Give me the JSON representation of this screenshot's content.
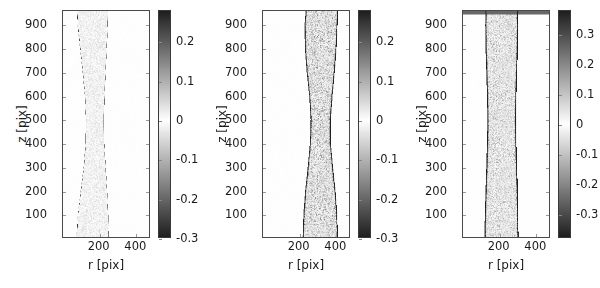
{
  "figure": {
    "background": "#ffffff",
    "panel_count": 3,
    "text_color": "#1a1a1a",
    "axis_color": "#4a4a4a"
  },
  "chart_data": [
    {
      "type": "heatmap",
      "panel_index": 0,
      "title": "",
      "xlabel": "r [pix]",
      "ylabel": "z [pix]",
      "xlim": [
        0,
        480
      ],
      "ylim": [
        0,
        960
      ],
      "xticks": [
        200,
        400
      ],
      "xticklabels": [
        "200",
        "400"
      ],
      "yticks": [
        100,
        200,
        300,
        400,
        500,
        600,
        700,
        800,
        900
      ],
      "yticklabels": [
        "100",
        "200",
        "300",
        "400",
        "500",
        "600",
        "700",
        "800",
        "900"
      ],
      "grid": false,
      "colormap": "diverging-gray",
      "colorbar": {
        "position": "right",
        "vmin": -0.3,
        "vmax": 0.28,
        "ticks": [
          0.2,
          0.1,
          0,
          -0.1,
          -0.2,
          -0.3
        ],
        "ticklabels": [
          "0.2",
          "0.1",
          "0",
          "-0.1",
          "-0.2",
          "-0.3"
        ]
      },
      "description": "Narrow bright column with thin dark boundary, pinched near mid height",
      "column": {
        "noise_amplitude": 0.05,
        "edge_darkness": 0.42,
        "edge_width": 2,
        "interior_level": 0.015,
        "profile": [
          {
            "z": 960,
            "left": 78,
            "right": 252
          },
          {
            "z": 900,
            "left": 82,
            "right": 250
          },
          {
            "z": 800,
            "left": 96,
            "right": 244
          },
          {
            "z": 700,
            "left": 110,
            "right": 238
          },
          {
            "z": 600,
            "left": 122,
            "right": 232
          },
          {
            "z": 500,
            "left": 128,
            "right": 228
          },
          {
            "z": 400,
            "left": 126,
            "right": 230
          },
          {
            "z": 300,
            "left": 116,
            "right": 238
          },
          {
            "z": 200,
            "left": 100,
            "right": 246
          },
          {
            "z": 100,
            "left": 84,
            "right": 252
          },
          {
            "z": 0,
            "left": 76,
            "right": 256
          }
        ]
      }
    },
    {
      "type": "heatmap",
      "panel_index": 1,
      "title": "",
      "xlabel": "r [pix]",
      "ylabel": "z [pix]",
      "xlim": [
        0,
        480
      ],
      "ylim": [
        0,
        960
      ],
      "xticks": [
        200,
        400
      ],
      "xticklabels": [
        "200",
        "400"
      ],
      "yticks": [
        100,
        200,
        300,
        400,
        500,
        600,
        700,
        800,
        900
      ],
      "yticklabels": [
        "100",
        "200",
        "300",
        "400",
        "500",
        "600",
        "700",
        "800",
        "900"
      ],
      "grid": false,
      "colormap": "diverging-gray",
      "colorbar": {
        "position": "right",
        "vmin": -0.3,
        "vmax": 0.28,
        "ticks": [
          0.2,
          0.1,
          0,
          -0.1,
          -0.2,
          -0.3
        ],
        "ticklabels": [
          "0.2",
          "0.1",
          "0",
          "-0.1",
          "-0.2",
          "-0.3"
        ]
      },
      "description": "Noisy speckled hourglass column shifted right, necked near mid height",
      "column": {
        "noise_amplitude": 0.17,
        "edge_darkness": 0.34,
        "edge_width": 9,
        "interior_level": 0.03,
        "profile": [
          {
            "z": 960,
            "left": 238,
            "right": 418
          },
          {
            "z": 900,
            "left": 232,
            "right": 416
          },
          {
            "z": 800,
            "left": 234,
            "right": 410
          },
          {
            "z": 700,
            "left": 244,
            "right": 400
          },
          {
            "z": 600,
            "left": 258,
            "right": 388
          },
          {
            "z": 500,
            "left": 266,
            "right": 378
          },
          {
            "z": 400,
            "left": 262,
            "right": 378
          },
          {
            "z": 300,
            "left": 250,
            "right": 390
          },
          {
            "z": 200,
            "left": 236,
            "right": 404
          },
          {
            "z": 100,
            "left": 226,
            "right": 414
          },
          {
            "z": 0,
            "left": 222,
            "right": 418
          }
        ]
      }
    },
    {
      "type": "heatmap",
      "panel_index": 2,
      "title": "",
      "xlabel": "r [pix]",
      "ylabel": "z [pix]",
      "xlim": [
        0,
        480
      ],
      "ylim": [
        0,
        960
      ],
      "xticks": [
        200,
        400
      ],
      "xticklabels": [
        "200",
        "400"
      ],
      "yticks": [
        100,
        200,
        300,
        400,
        500,
        600,
        700,
        800,
        900
      ],
      "yticklabels": [
        "100",
        "200",
        "300",
        "400",
        "500",
        "600",
        "700",
        "800",
        "900"
      ],
      "grid": false,
      "colormap": "diverging-gray",
      "colorbar": {
        "position": "right",
        "vmin": -0.38,
        "vmax": 0.38,
        "ticks": [
          0.3,
          0.2,
          0.1,
          0,
          -0.1,
          -0.2,
          -0.3
        ],
        "ticklabels": [
          "0.3",
          "0.2",
          "0.1",
          "0",
          "-0.1",
          "-0.2",
          "-0.3"
        ]
      },
      "description": "Wide speckled column with strong dark vertical edges and dark horizontal band near top",
      "top_band": {
        "z": 952,
        "level": 0.3
      },
      "column": {
        "noise_amplitude": 0.2,
        "edge_darkness": 0.46,
        "edge_width": 11,
        "interior_level": 0.02,
        "profile": [
          {
            "z": 960,
            "left": 126,
            "right": 306
          },
          {
            "z": 900,
            "left": 124,
            "right": 308
          },
          {
            "z": 800,
            "left": 126,
            "right": 306
          },
          {
            "z": 700,
            "left": 130,
            "right": 302
          },
          {
            "z": 600,
            "left": 134,
            "right": 298
          },
          {
            "z": 500,
            "left": 136,
            "right": 296
          },
          {
            "z": 400,
            "left": 134,
            "right": 298
          },
          {
            "z": 300,
            "left": 130,
            "right": 302
          },
          {
            "z": 200,
            "left": 126,
            "right": 306
          },
          {
            "z": 100,
            "left": 122,
            "right": 308
          },
          {
            "z": 0,
            "left": 120,
            "right": 310
          }
        ]
      }
    }
  ]
}
